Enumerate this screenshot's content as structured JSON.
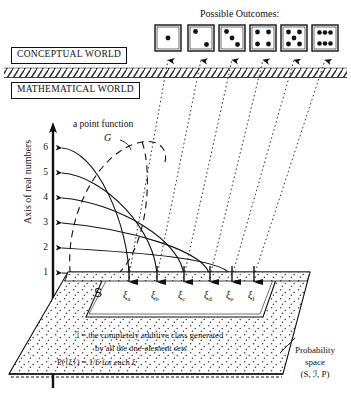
{
  "figure": {
    "title_outcomes": "Possible Outcomes:",
    "conceptual_world": "CONCEPTUAL WORLD",
    "mathematical_world": "MATHEMATICAL WORLD",
    "point_function_label": "a point function",
    "point_function_name": "G",
    "axis_title": "Axis of real numbers",
    "axis_ticks": [
      "1",
      "2",
      "3",
      "4",
      "5",
      "6"
    ],
    "sample_space_label": "S",
    "class_line_1": "ℐ = the completely additive class generated",
    "class_line_2": "by all the one-element sets",
    "probability_line": "P({ξ}) = 1/6 for each ξ",
    "prob_space_label_1": "Probability",
    "prob_space_label_2": "space",
    "prob_space_label_3": "(S, ℐ, P)",
    "dice": [
      {
        "name": "die-face-1",
        "pips": 1
      },
      {
        "name": "die-face-2",
        "pips": 2
      },
      {
        "name": "die-face-3",
        "pips": 3
      },
      {
        "name": "die-face-4",
        "pips": 4
      },
      {
        "name": "die-face-5",
        "pips": 5
      },
      {
        "name": "die-face-6",
        "pips": 6
      }
    ],
    "outcome_points": [
      {
        "label": "ξ",
        "sub": "a"
      },
      {
        "label": "ξ",
        "sub": "b"
      },
      {
        "label": "ξ",
        "sub": "c"
      },
      {
        "label": "ξ",
        "sub": "d"
      },
      {
        "label": "ξ",
        "sub": "e"
      },
      {
        "label": "ξ",
        "sub": "f"
      }
    ],
    "colors": {
      "ink": "#111111",
      "paper": "#ffffff",
      "stipple": "#333333"
    }
  }
}
